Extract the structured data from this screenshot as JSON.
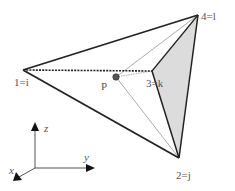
{
  "diagram": {
    "type": "tetrahedron-with-interior-point",
    "colors": {
      "edge": "#222222",
      "thin_edge": "#888888",
      "face_fill": "#dcdcdc",
      "point_fill": "#555555",
      "label": "#555555"
    },
    "vertices": [
      {
        "id": "1",
        "label": "1=i",
        "x": 23,
        "y": 70,
        "label_x": 14,
        "label_y": 86
      },
      {
        "id": "2",
        "label": "2=j",
        "x": 179,
        "y": 158,
        "label_x": 176,
        "label_y": 179
      },
      {
        "id": "3",
        "label": "3=k",
        "x": 152,
        "y": 71,
        "label_x": 147,
        "label_y": 87
      },
      {
        "id": "4",
        "label": "4=l",
        "x": 198,
        "y": 15,
        "label_x": 201,
        "label_y": 20
      }
    ],
    "point": {
      "label": "P",
      "x": 116,
      "y": 77,
      "label_x": 101,
      "label_y": 90
    },
    "axes": {
      "origin": {
        "x": 35,
        "y": 168
      },
      "z": {
        "label": "z",
        "x": 35,
        "y": 124,
        "label_x": 44,
        "label_y": 132
      },
      "y": {
        "label": "y",
        "x": 94,
        "y": 168,
        "label_x": 84,
        "label_y": 161
      },
      "x": {
        "label": "x",
        "x": 14,
        "y": 180,
        "label_x": 9,
        "label_y": 174
      }
    }
  }
}
